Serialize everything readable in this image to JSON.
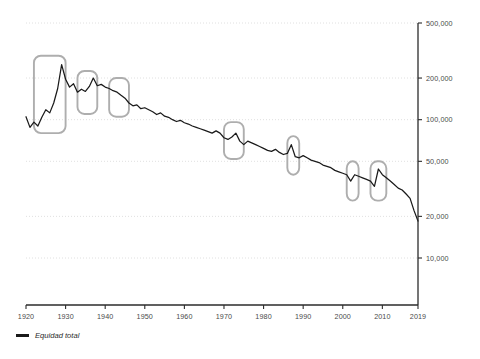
{
  "chart_data": {
    "type": "line",
    "title": "",
    "subtitle": "",
    "xlabel": "",
    "ylabel": "",
    "yscale": "log",
    "ylim": [
      7000,
      600000
    ],
    "xlim": [
      1920,
      2019
    ],
    "grid": true,
    "legend_position": "bottom-left",
    "ytick_labels": [
      "500,000",
      "200,000",
      "100,000",
      "50,000",
      "20,000",
      "10,000"
    ],
    "ytick_values": [
      500000,
      200000,
      100000,
      50000,
      20000,
      10000
    ],
    "xtick_labels": [
      "1920",
      "1930",
      "1940",
      "1950",
      "1960",
      "1970",
      "1980",
      "1990",
      "2000",
      "2010",
      "2019"
    ],
    "xtick_values": [
      1920,
      1930,
      1940,
      1950,
      1960,
      1970,
      1980,
      1990,
      2000,
      2010,
      2019
    ],
    "series": [
      {
        "name": "Equidad total",
        "color": "#1a1a1a",
        "x": [
          1920,
          1921,
          1922,
          1923,
          1924,
          1925,
          1926,
          1927,
          1928,
          1929,
          1930,
          1931,
          1932,
          1933,
          1934,
          1935,
          1936,
          1937,
          1938,
          1939,
          1940,
          1941,
          1942,
          1943,
          1944,
          1945,
          1946,
          1947,
          1948,
          1949,
          1950,
          1951,
          1952,
          1953,
          1954,
          1955,
          1956,
          1957,
          1958,
          1959,
          1960,
          1961,
          1962,
          1963,
          1964,
          1965,
          1966,
          1967,
          1968,
          1969,
          1970,
          1971,
          1972,
          1973,
          1974,
          1975,
          1976,
          1977,
          1978,
          1979,
          1980,
          1981,
          1982,
          1983,
          1984,
          1985,
          1986,
          1987,
          1988,
          1989,
          1990,
          1991,
          1992,
          1993,
          1994,
          1995,
          1996,
          1997,
          1998,
          1999,
          2000,
          2001,
          2002,
          2003,
          2004,
          2005,
          2006,
          2007,
          2008,
          2009,
          2010,
          2011,
          2012,
          2013,
          2014,
          2015,
          2016,
          2017,
          2018,
          2019
        ],
        "values": [
          105000,
          88000,
          96000,
          90000,
          104000,
          118000,
          112000,
          132000,
          168000,
          250000,
          196000,
          172000,
          182000,
          158000,
          166000,
          160000,
          174000,
          200000,
          176000,
          180000,
          172000,
          168000,
          162000,
          158000,
          150000,
          143000,
          132000,
          126000,
          128000,
          120000,
          122000,
          118000,
          114000,
          109000,
          112000,
          106000,
          104000,
          100000,
          97000,
          99000,
          95000,
          93000,
          90000,
          88000,
          86000,
          84000,
          82000,
          80000,
          83000,
          80000,
          74000,
          72000,
          75000,
          80000,
          70000,
          66000,
          70000,
          68000,
          66000,
          64000,
          62000,
          60000,
          59000,
          61000,
          58000,
          56000,
          57000,
          66000,
          54000,
          53000,
          55000,
          53000,
          51000,
          50000,
          49000,
          47000,
          46000,
          45000,
          43000,
          42000,
          41000,
          40000,
          36000,
          40000,
          39000,
          38000,
          37000,
          36000,
          33000,
          44000,
          40000,
          38000,
          36000,
          34000,
          32000,
          31000,
          29000,
          27000,
          22000,
          18500
        ]
      }
    ],
    "annotations": [
      {
        "label": "highlight-box-1",
        "x_start": 1922,
        "x_end": 1930,
        "y_top": 290000,
        "y_bottom": 80000
      },
      {
        "label": "highlight-box-2",
        "x_start": 1933,
        "x_end": 1938,
        "y_top": 225000,
        "y_bottom": 110000
      },
      {
        "label": "highlight-box-3",
        "x_start": 1941,
        "x_end": 1946,
        "y_top": 200000,
        "y_bottom": 105000
      },
      {
        "label": "highlight-box-4",
        "x_start": 1970,
        "x_end": 1975,
        "y_top": 96000,
        "y_bottom": 52000
      },
      {
        "label": "highlight-box-5",
        "x_start": 1986,
        "x_end": 1989,
        "y_top": 76000,
        "y_bottom": 40000
      },
      {
        "label": "highlight-box-6",
        "x_start": 2001,
        "x_end": 2004,
        "y_top": 50000,
        "y_bottom": 26000
      },
      {
        "label": "highlight-box-7",
        "x_start": 2007,
        "x_end": 2011,
        "y_top": 50000,
        "y_bottom": 26000
      }
    ]
  },
  "legend": {
    "entries": [
      {
        "label": "Equidad total",
        "color": "#1a1a1a"
      }
    ]
  }
}
